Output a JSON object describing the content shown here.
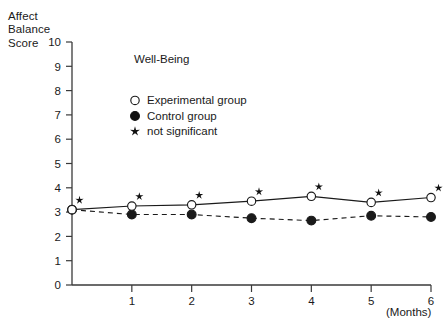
{
  "figure": {
    "y_axis_caption_lines": [
      "Affect",
      "Balance",
      "Score"
    ],
    "x_unit_label": "(Months)"
  },
  "legend": {
    "panel_label": "Well-Being",
    "entries": [
      {
        "label": "Experimental group",
        "marker": "open-circle-icon"
      },
      {
        "label": "Control group",
        "marker": "filled-circle-icon"
      },
      {
        "label": "not significant",
        "marker": "star-icon"
      }
    ]
  },
  "chart_data": {
    "type": "line",
    "title": "Well-Being",
    "xlabel": "(Months)",
    "ylabel": "Affect Balance Score",
    "x": [
      0,
      1,
      2,
      3,
      4,
      5,
      6
    ],
    "xtick_labels": [
      "",
      "1",
      "2",
      "3",
      "4",
      "5",
      "6"
    ],
    "ytick_labels": [
      "0",
      "1",
      "2",
      "3",
      "4",
      "5",
      "6",
      "7",
      "8",
      "9",
      "10"
    ],
    "xlim": [
      0,
      6
    ],
    "ylim": [
      0,
      10
    ],
    "grid": false,
    "legend_position": "upper-left-inside",
    "series": [
      {
        "name": "Experimental group",
        "values": [
          3.1,
          3.25,
          3.3,
          3.45,
          3.65,
          3.4,
          3.6
        ],
        "marker": "open-circle",
        "linestyle": "solid",
        "color": "#1a1a1a"
      },
      {
        "name": "Control group",
        "values": [
          3.1,
          2.9,
          2.9,
          2.75,
          2.65,
          2.85,
          2.8
        ],
        "marker": "filled-circle",
        "linestyle": "dashed",
        "color": "#1a1a1a"
      }
    ],
    "annotations": {
      "symbol": "star",
      "meaning": "not significant",
      "at_x": [
        0,
        1,
        2,
        3,
        4,
        5,
        6
      ]
    }
  }
}
